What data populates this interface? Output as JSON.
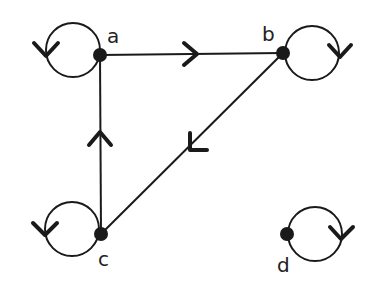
{
  "diagram": {
    "type": "directed-graph",
    "vertices": [
      {
        "id": "a",
        "label": "a"
      },
      {
        "id": "b",
        "label": "b"
      },
      {
        "id": "c",
        "label": "c"
      },
      {
        "id": "d",
        "label": "d"
      }
    ],
    "edges": [
      {
        "from": "a",
        "to": "b"
      },
      {
        "from": "c",
        "to": "a"
      },
      {
        "from": "b",
        "to": "c"
      }
    ],
    "loops": [
      {
        "vertex": "a"
      },
      {
        "vertex": "b"
      },
      {
        "vertex": "c"
      },
      {
        "vertex": "d"
      }
    ],
    "colors": {
      "stroke": "#1a1a1a",
      "background": "#ffffff"
    }
  }
}
